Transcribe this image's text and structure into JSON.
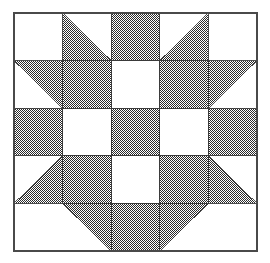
{
  "figure": {
    "kind": "quilt-block",
    "grid_rows": 5,
    "grid_cols": 5
  },
  "canvas": {
    "width": 270,
    "height": 263,
    "background_color": "#ffffff"
  },
  "block": {
    "x": 14,
    "y": 13,
    "width": 243,
    "height": 238,
    "cell_width": 48.6,
    "cell_height": 47.6,
    "border_color": "#4a4a4a",
    "border_width": 1.6
  },
  "colors": {
    "patch_dark": "#6e6e6e",
    "patch_light": "#ffffff",
    "outline": "#3a3a3a",
    "dither_dot": "#2b2b2b"
  },
  "legend": {
    "dark_label": "Dark patch",
    "light_label": "Light patch",
    "dark_fill_style": "checkerboard-dither"
  },
  "chart_data": {
    "type": "heatmap",
    "xlabel": "",
    "ylabel": "",
    "grid": true,
    "legend_position": "none",
    "categories": [
      "col0",
      "col1",
      "col2",
      "col3",
      "col4"
    ],
    "row_labels": [
      "row0",
      "row1",
      "row2",
      "row3",
      "row4"
    ],
    "cell_codes": [
      [
        "L",
        "TL_BL",
        "D",
        "TL_BR",
        "L"
      ],
      [
        "TL_TR",
        "D",
        "L",
        "D",
        "TL_TL"
      ],
      [
        "D",
        "L",
        "D",
        "L",
        "D"
      ],
      [
        "TL_BR",
        "D",
        "L",
        "D",
        "TL_BL"
      ],
      [
        "L",
        "TL_TR",
        "D",
        "TL_TL",
        "L"
      ]
    ],
    "code_meanings": {
      "L": "solid light square",
      "D": "solid dark square",
      "TL_BL": "dark triangle occupying bottom-left half",
      "TL_BR": "dark triangle occupying bottom-right half",
      "TL_TL": "dark triangle occupying top-left half",
      "TL_TR": "dark triangle occupying top-right half"
    },
    "dark_area_fraction": 0.52,
    "values": [
      [
        0,
        0.5,
        1,
        0.5,
        0
      ],
      [
        0.5,
        1,
        0,
        1,
        0.5
      ],
      [
        1,
        0,
        1,
        0,
        1
      ],
      [
        0.5,
        1,
        0,
        1,
        0.5
      ],
      [
        0,
        0.5,
        1,
        0.5,
        0
      ]
    ]
  }
}
